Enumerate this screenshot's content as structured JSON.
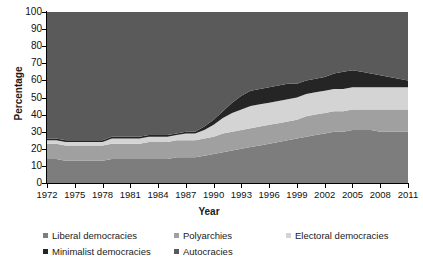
{
  "chart_data": {
    "type": "area",
    "stacked": true,
    "title": "",
    "xlabel": "Year",
    "ylabel": "Percentage",
    "xlim": [
      1972,
      2011
    ],
    "ylim": [
      0,
      100
    ],
    "grid": false,
    "legend_position": "bottom",
    "x": [
      1972,
      1973,
      1974,
      1975,
      1976,
      1977,
      1978,
      1979,
      1980,
      1981,
      1982,
      1983,
      1984,
      1985,
      1986,
      1987,
      1988,
      1989,
      1990,
      1991,
      1992,
      1993,
      1994,
      1995,
      1996,
      1997,
      1998,
      1999,
      2000,
      2001,
      2002,
      2003,
      2004,
      2005,
      2006,
      2007,
      2008,
      2009,
      2010,
      2011
    ],
    "xticks": [
      1972,
      1975,
      1978,
      1981,
      1984,
      1987,
      1990,
      1993,
      1996,
      1999,
      2002,
      2005,
      2008,
      2011
    ],
    "yticks": [
      0,
      10,
      20,
      30,
      40,
      50,
      60,
      70,
      80,
      90,
      100
    ],
    "series": [
      {
        "name": "Liberal democracies",
        "color": "#7d7d7d",
        "values": [
          14,
          14,
          13,
          13,
          13,
          13,
          13,
          14,
          14,
          14,
          14,
          14,
          14,
          14,
          15,
          15,
          15,
          16,
          17,
          18,
          19,
          20,
          21,
          22,
          23,
          24,
          25,
          26,
          27,
          28,
          29,
          30,
          30,
          31,
          31,
          31,
          30,
          30,
          30,
          30
        ]
      },
      {
        "name": "Polyarchies",
        "color": "#a0a0a0",
        "values": [
          9,
          9,
          9,
          9,
          9,
          9,
          9,
          9,
          9,
          9,
          9,
          10,
          10,
          10,
          10,
          10,
          10,
          10,
          10,
          11,
          11,
          11,
          11,
          11,
          11,
          11,
          11,
          11,
          12,
          12,
          12,
          12,
          12,
          12,
          12,
          12,
          13,
          13,
          13,
          13
        ]
      },
      {
        "name": "Electoral democracies",
        "color": "#d4d4d4",
        "values": [
          2,
          2,
          2,
          2,
          2,
          2,
          2,
          3,
          3,
          3,
          3,
          3,
          3,
          3,
          3,
          4,
          4,
          5,
          7,
          9,
          11,
          12,
          13,
          13,
          13,
          13,
          13,
          13,
          13,
          13,
          13,
          13,
          13,
          13,
          13,
          13,
          13,
          13,
          13,
          13
        ]
      },
      {
        "name": "Minimalist democracies",
        "color": "#252525",
        "values": [
          1,
          1,
          1,
          1,
          1,
          1,
          1,
          1,
          1,
          1,
          1,
          1,
          1,
          1,
          1,
          1,
          1,
          2,
          3,
          4,
          6,
          8,
          9,
          9,
          9,
          9,
          9,
          8,
          8,
          8,
          8,
          9,
          10,
          10,
          9,
          8,
          7,
          6,
          5,
          4
        ]
      },
      {
        "name": "Autocracies",
        "color": "#5a5a5a",
        "values": [
          74,
          74,
          75,
          75,
          75,
          75,
          75,
          73,
          73,
          73,
          73,
          72,
          72,
          72,
          71,
          70,
          70,
          67,
          63,
          58,
          53,
          49,
          46,
          45,
          44,
          43,
          42,
          42,
          40,
          39,
          38,
          36,
          35,
          34,
          35,
          36,
          37,
          38,
          39,
          40
        ]
      }
    ]
  },
  "axes": {
    "ylabel": "Percentage",
    "xlabel": "Year",
    "ytick_labels": [
      "100",
      "90",
      "80",
      "70",
      "60",
      "50",
      "40",
      "30",
      "20",
      "10",
      "0"
    ],
    "xtick_labels": [
      "1972",
      "1975",
      "1978",
      "1981",
      "1984",
      "1987",
      "1990",
      "1993",
      "1996",
      "1999",
      "2002",
      "2005",
      "2008",
      "2011"
    ]
  },
  "legend": {
    "items": [
      {
        "label": "Liberal democracies",
        "color": "#7d7d7d"
      },
      {
        "label": "Polyarchies",
        "color": "#a0a0a0"
      },
      {
        "label": "Electoral democracies",
        "color": "#d4d4d4"
      },
      {
        "label": "Minimalist democracies",
        "color": "#252525"
      },
      {
        "label": "Autocracies",
        "color": "#5a5a5a"
      }
    ]
  }
}
